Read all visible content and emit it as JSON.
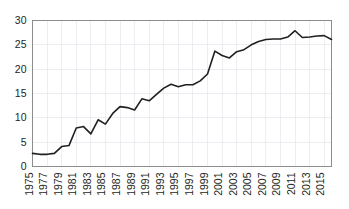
{
  "chart_data": {
    "type": "line",
    "title": "",
    "subtitle": "",
    "xlabel": "",
    "ylabel": "",
    "xlim": [
      1975,
      2016
    ],
    "ylim": [
      0,
      30
    ],
    "y_ticks": [
      0,
      5,
      10,
      15,
      20,
      25,
      30
    ],
    "x_ticks": [
      1975,
      1977,
      1979,
      1981,
      1983,
      1985,
      1987,
      1989,
      1991,
      1993,
      1995,
      1997,
      1999,
      2001,
      2003,
      2005,
      2007,
      2009,
      2011,
      2013,
      2015
    ],
    "x_tick_labels": [
      "1975",
      "1977",
      "1979",
      "1981",
      "1983",
      "1985",
      "1987",
      "1989",
      "1991",
      "1993",
      "1995",
      "1997",
      "1999",
      "2001",
      "2003",
      "2005",
      "2007",
      "2009",
      "2011",
      "2013",
      "2015"
    ],
    "y_tick_labels": [
      "0",
      "5",
      "10",
      "15",
      "20",
      "25",
      "30"
    ],
    "grid": true,
    "grid_color": "#d9dde3",
    "line_color": "#231f20",
    "legend": [],
    "legend_position": "none",
    "annotations": [],
    "x": [
      1975,
      1976,
      1977,
      1978,
      1979,
      1980,
      1981,
      1982,
      1983,
      1984,
      1985,
      1986,
      1987,
      1988,
      1989,
      1990,
      1991,
      1992,
      1993,
      1994,
      1995,
      1996,
      1997,
      1998,
      1999,
      2000,
      2001,
      2002,
      2003,
      2004,
      2005,
      2006,
      2007,
      2008,
      2009,
      2010,
      2011,
      2012,
      2013,
      2014,
      2015,
      2016
    ],
    "values": [
      2.7,
      2.5,
      2.5,
      2.7,
      4.1,
      4.3,
      7.9,
      8.2,
      6.7,
      9.6,
      8.7,
      10.9,
      12.3,
      12.1,
      11.6,
      13.9,
      13.5,
      14.8,
      16.1,
      16.9,
      16.4,
      16.8,
      16.8,
      17.6,
      19.0,
      23.7,
      22.8,
      22.3,
      23.6,
      24.0,
      25.0,
      25.7,
      26.1,
      26.2,
      26.2,
      26.6,
      27.9,
      26.5,
      26.6,
      26.8,
      26.9,
      26.1
    ],
    "series": [
      {
        "name": "series-1",
        "color": "#231f20",
        "values": [
          2.7,
          2.5,
          2.5,
          2.7,
          4.1,
          4.3,
          7.9,
          8.2,
          6.7,
          9.6,
          8.7,
          10.9,
          12.3,
          12.1,
          11.6,
          13.9,
          13.5,
          14.8,
          16.1,
          16.9,
          16.4,
          16.8,
          16.8,
          17.6,
          19.0,
          23.7,
          22.8,
          22.3,
          23.6,
          24.0,
          25.0,
          25.7,
          26.1,
          26.2,
          26.2,
          26.6,
          27.9,
          26.5,
          26.6,
          26.8,
          26.9,
          26.1
        ]
      }
    ]
  }
}
